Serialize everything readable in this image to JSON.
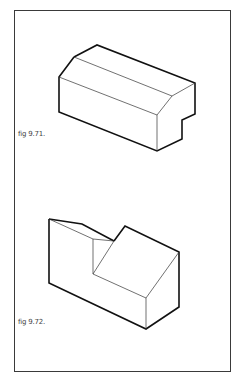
{
  "figures": [
    {
      "label": "fig 9.71.",
      "description": "isometric block with chamfered top edge and notch"
    },
    {
      "label": "fig 9.72.",
      "description": "isometric block with sloped face and cut-out step"
    }
  ],
  "colors": {
    "line": "#111111",
    "frame": "#3a3a3a",
    "caption": "#444444"
  }
}
